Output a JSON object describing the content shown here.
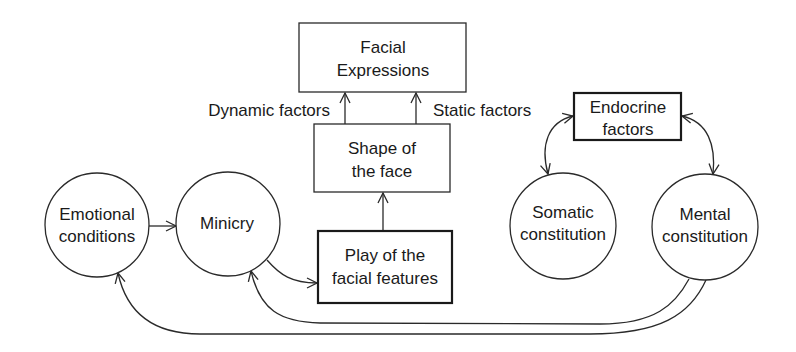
{
  "nodes": {
    "facial_expressions": {
      "lines": [
        "Facial",
        "Expressions"
      ],
      "shape": "box"
    },
    "shape_of_face": {
      "lines": [
        "Shape of",
        "the face"
      ],
      "shape": "box"
    },
    "play_of_features": {
      "lines": [
        "Play of the",
        "facial features"
      ],
      "shape": "box-bold"
    },
    "endocrine_factors": {
      "lines": [
        "Endocrine",
        "factors"
      ],
      "shape": "box-bold"
    },
    "emotional_conditions": {
      "lines": [
        "Emotional",
        "conditions"
      ],
      "shape": "circle"
    },
    "minicry": {
      "lines": [
        "Minicry"
      ],
      "shape": "circle"
    },
    "somatic_constitution": {
      "lines": [
        "Somatic",
        "constitution"
      ],
      "shape": "circle"
    },
    "mental_constitution": {
      "lines": [
        "Mental",
        "constitution"
      ],
      "shape": "circle"
    }
  },
  "edge_labels": {
    "dynamic": "Dynamic factors",
    "static": "Static factors"
  },
  "edges": [
    {
      "from": "shape_of_face",
      "to": "facial_expressions",
      "label": "Dynamic factors"
    },
    {
      "from": "shape_of_face",
      "to": "facial_expressions",
      "label": "Static factors"
    },
    {
      "from": "play_of_features",
      "to": "shape_of_face"
    },
    {
      "from": "emotional_conditions",
      "to": "minicry"
    },
    {
      "from": "minicry",
      "to": "play_of_features"
    },
    {
      "from": "endocrine_factors",
      "to": "somatic_constitution",
      "bidirectional": true
    },
    {
      "from": "endocrine_factors",
      "to": "mental_constitution",
      "bidirectional": true
    },
    {
      "from": "mental_constitution",
      "to": "minicry"
    },
    {
      "from": "mental_constitution",
      "to": "emotional_conditions"
    }
  ],
  "colors": {
    "stroke": "#2a2a2a",
    "text": "#1a1a1a",
    "background": "#ffffff"
  }
}
